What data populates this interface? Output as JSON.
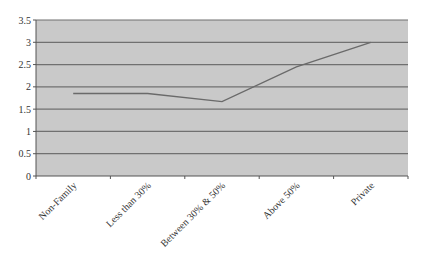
{
  "chart_data": {
    "type": "line",
    "title": "",
    "xlabel": "",
    "ylabel": "",
    "categories": [
      "Non-Family",
      "Less than 30%",
      "Between 30% & 50%",
      "Above 50%",
      "Private"
    ],
    "series": [
      {
        "name": "Series 1",
        "values": [
          1.85,
          1.85,
          1.67,
          2.45,
          3.0
        ]
      }
    ],
    "ylim": [
      0,
      3.5
    ],
    "yticks": [
      0,
      0.5,
      1,
      1.5,
      2,
      2.5,
      3,
      3.5
    ],
    "ytick_labels": [
      "0",
      "0.5",
      "1",
      "1.5",
      "2",
      "2.5",
      "3",
      "3.5"
    ],
    "grid": true,
    "legend": "none"
  },
  "colors": {
    "plot_background": "#c9c9c9",
    "gridline": "#707070",
    "line": "#6a6a6a",
    "axis": "#555555",
    "text": "#333333"
  }
}
